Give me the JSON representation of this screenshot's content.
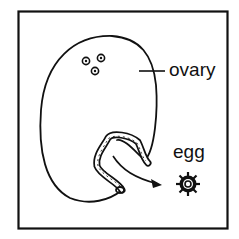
{
  "diagram": {
    "labels": {
      "ovary": "ovary",
      "egg": "egg"
    },
    "colors": {
      "stroke": "#111111",
      "background": "#ffffff"
    }
  }
}
